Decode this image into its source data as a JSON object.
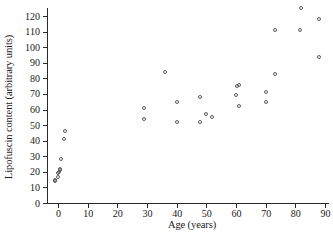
{
  "chart_data": {
    "type": "scatter",
    "title": "",
    "xlabel": "Age (years)",
    "ylabel": "Lipofuscin content (arbitrary units)",
    "xlim": [
      0,
      90
    ],
    "ylim": [
      0,
      120
    ],
    "xticks": [
      0,
      10,
      20,
      30,
      40,
      50,
      60,
      70,
      80,
      90
    ],
    "yticks": [
      0,
      10,
      20,
      30,
      40,
      50,
      60,
      70,
      80,
      90,
      100,
      110,
      120
    ],
    "grid": false,
    "legend": null,
    "marker": "open-circle",
    "marker_color": "#5c5c5c",
    "points": [
      {
        "x": -1,
        "y": 14
      },
      {
        "x": -1,
        "y": 15
      },
      {
        "x": 0,
        "y": 17
      },
      {
        "x": 0,
        "y": 19
      },
      {
        "x": 0.5,
        "y": 20
      },
      {
        "x": 0.6,
        "y": 21
      },
      {
        "x": 0.8,
        "y": 22
      },
      {
        "x": 1,
        "y": 28
      },
      {
        "x": 2,
        "y": 41
      },
      {
        "x": 2.5,
        "y": 46
      },
      {
        "x": 29,
        "y": 61
      },
      {
        "x": 29,
        "y": 54
      },
      {
        "x": 36,
        "y": 84
      },
      {
        "x": 40,
        "y": 65
      },
      {
        "x": 40,
        "y": 52
      },
      {
        "x": 48,
        "y": 68
      },
      {
        "x": 48,
        "y": 52
      },
      {
        "x": 50,
        "y": 57
      },
      {
        "x": 52,
        "y": 55
      },
      {
        "x": 60,
        "y": 69
      },
      {
        "x": 60.5,
        "y": 75
      },
      {
        "x": 61,
        "y": 76
      },
      {
        "x": 61,
        "y": 62
      },
      {
        "x": 70,
        "y": 71
      },
      {
        "x": 70,
        "y": 65
      },
      {
        "x": 73,
        "y": 111
      },
      {
        "x": 73,
        "y": 83
      },
      {
        "x": 81.5,
        "y": 111
      },
      {
        "x": 82,
        "y": 125
      },
      {
        "x": 88,
        "y": 118
      },
      {
        "x": 88,
        "y": 94
      }
    ]
  }
}
